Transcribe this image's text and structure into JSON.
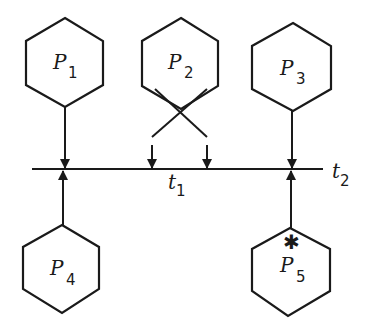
{
  "diagram": {
    "type": "petri-net-style process diagram",
    "places": [
      {
        "id": "P1",
        "letter": "P",
        "sub": "1",
        "marked": false
      },
      {
        "id": "P2",
        "letter": "P",
        "sub": "2",
        "marked": false
      },
      {
        "id": "P3",
        "letter": "P",
        "sub": "3",
        "marked": false
      },
      {
        "id": "P4",
        "letter": "P",
        "sub": "4",
        "marked": false
      },
      {
        "id": "P5",
        "letter": "P",
        "sub": "5",
        "marked": true,
        "mark_symbol": "✱"
      }
    ],
    "transitions": [
      {
        "id": "t1",
        "letter": "t",
        "sub": "1"
      },
      {
        "id": "t2",
        "letter": "t",
        "sub": "2"
      }
    ],
    "edges": [
      {
        "from": "P1",
        "to": "t1"
      },
      {
        "from": "P4",
        "to": "t1"
      },
      {
        "from": "P2",
        "to": "t1",
        "note": "crossed output arcs"
      },
      {
        "from": "P2",
        "to": "t1",
        "note": "crossed output arcs"
      },
      {
        "from": "P3",
        "to": "t2"
      },
      {
        "from": "P5",
        "to": "t2"
      }
    ],
    "colors": {
      "stroke": "#1a1a1a",
      "background": "#ffffff"
    }
  }
}
